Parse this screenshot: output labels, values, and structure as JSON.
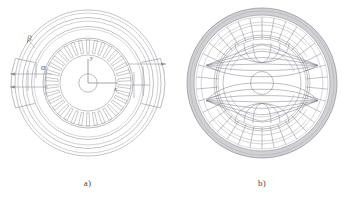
{
  "figure": {
    "background_color": "#ffffff",
    "line_color": "#8d8d93",
    "line_color_dark": "#6d6d74",
    "line_color_light": "#b9b9bf",
    "yoke_fill": "#c9c9cc",
    "flux_color": "#7d7d86",
    "panels": [
      {
        "id": "a",
        "caption": "a)",
        "description": "cross-section geometry of the electrical machine with concentric stator rings, slotted rotor and dimension callouts",
        "labels": {
          "beta": "β",
          "alpha": "α",
          "axis_x": "x",
          "axis_y": "y"
        },
        "geometry": {
          "center_x": 88,
          "center_y": 83,
          "outer_radius": 73,
          "rings": [
            73,
            69,
            64,
            59,
            55
          ],
          "rotor_outer_radius": 45,
          "rotor_inner_radius": 28,
          "shaft_radius": 9,
          "slot_count": 34,
          "slot_inner_radius": 30,
          "slot_outer_radius": 43,
          "segment_angles_deg": [
            0,
            180
          ],
          "alpha_angle_deg": 168,
          "beta_angle_deg": 143
        }
      },
      {
        "id": "b",
        "caption": "b)",
        "description": "magnetic flux line distribution over the same cross-section",
        "labels": {},
        "geometry": {
          "center_x": 87,
          "center_y": 83,
          "outer_radius": 75,
          "yoke_inner_radius": 68,
          "tooth_count": 34,
          "tooth_inner_radius": 44,
          "tooth_outer_radius": 66,
          "core_radius": 44,
          "shaft_radius": 11,
          "flux_line_count": 13
        }
      }
    ]
  },
  "chart_data": {
    "type": "diagram",
    "title": "",
    "panels": [
      "a)",
      "b)"
    ],
    "annotations": [
      "β",
      "α",
      "x",
      "y"
    ]
  }
}
